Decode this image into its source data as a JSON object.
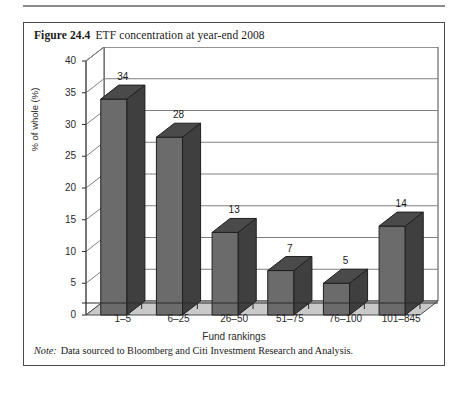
{
  "figure": {
    "number": "Figure 24.4",
    "title": "ETF concentration at year-end 2008",
    "note_label": "Note:",
    "note_text": "Data sourced to Bloomberg and Citi Investment Research and Analysis."
  },
  "colors": {
    "bar_front": "#6b6b6b",
    "bar_top": "#4a4a4a",
    "bar_side": "#3f3f3f",
    "floor": "#c9c9c9",
    "wall": "#ffffff",
    "gridline": "#808080",
    "frame": "#4a4a4a",
    "text": "#1a1a1a"
  },
  "chart_data": {
    "type": "bar",
    "title": "ETF concentration at year-end 2008",
    "categories": [
      "1–5",
      "6–25",
      "26–50",
      "51–75",
      "76–100",
      "101–845"
    ],
    "values": [
      34,
      28,
      13,
      7,
      5,
      14
    ],
    "labels": [
      "34",
      "28",
      "13",
      "7",
      "5",
      "14"
    ],
    "xlabel": "Fund rankings",
    "ylabel": "% of whole (%)",
    "ylim": [
      0,
      40
    ],
    "yticks": [
      0,
      5,
      10,
      15,
      20,
      25,
      30,
      35,
      40
    ],
    "ytick_labels": [
      "0",
      "5",
      "10",
      "15",
      "20",
      "25",
      "30",
      "35",
      "40"
    ],
    "grid": true,
    "legend": null,
    "style": "3d-column"
  }
}
